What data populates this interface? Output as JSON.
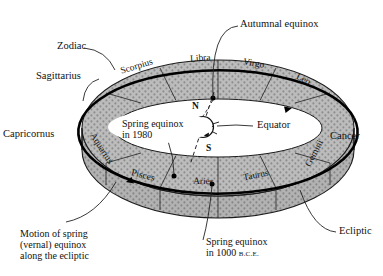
{
  "diagram": {
    "title_visible": false,
    "type": "zodiac-ring-precession-diagram",
    "colors": {
      "band_fill": "#b9b9b9",
      "band_stipple": "#8f8f8f",
      "band_edge": "#1a1a1a",
      "ecliptic": "#000000",
      "hole_fill": "#ffffff",
      "text": "#111111"
    },
    "zodiac_band": {
      "label": "Zodiac",
      "segments": [
        {
          "name": "Sagittarius",
          "position": "front-left-outer"
        },
        {
          "name": "Scorpius",
          "position": "top-left"
        },
        {
          "name": "Libra",
          "position": "top-center-left"
        },
        {
          "name": "Virgo",
          "position": "top-center-right"
        },
        {
          "name": "Leo",
          "position": "top-right"
        },
        {
          "name": "Cancer",
          "position": "right-outer"
        },
        {
          "name": "Gemini",
          "position": "bottom-right"
        },
        {
          "name": "Taurus",
          "position": "bottom-center-right"
        },
        {
          "name": "Aries",
          "position": "bottom-center"
        },
        {
          "name": "Pisces",
          "position": "bottom-center-left"
        },
        {
          "name": "Aquarius",
          "position": "bottom-left"
        },
        {
          "name": "Capricornus",
          "position": "left-outer"
        }
      ]
    },
    "annotations": {
      "zodiac": "Zodiac",
      "autumnal_equinox": "Autumnal equinox",
      "equator": "Equator",
      "ecliptic": "Ecliptic",
      "spring_equinox_1980_line1": "Spring equinox",
      "spring_equinox_1980_line2": "in 1980",
      "spring_equinox_bce_line1": "Spring equinox",
      "spring_equinox_bce_line2_num": "in 1000 ",
      "spring_equinox_bce_line2_era": "B.C.E.",
      "motion_caption_line1": "Motion of spring",
      "motion_caption_line2": "(vernal) equinox",
      "motion_caption_line3": "along the ecliptic"
    },
    "earth": {
      "north_pole": "N",
      "south_pole": "S",
      "axis_style": "dashed-tilted"
    },
    "equinox_markers": [
      {
        "name": "autumnal-equinox-point",
        "on": "ecliptic-top"
      },
      {
        "name": "spring-equinox-1980-point",
        "on": "ecliptic-bottom-left"
      },
      {
        "name": "spring-equinox-1000bce-point",
        "on": "ecliptic-bottom-center"
      }
    ],
    "ecliptic_arrows": [
      {
        "name": "arrow-top-right",
        "direction": "clockwise-right"
      },
      {
        "name": "arrow-bottom-left",
        "direction": "clockwise-left"
      }
    ]
  }
}
